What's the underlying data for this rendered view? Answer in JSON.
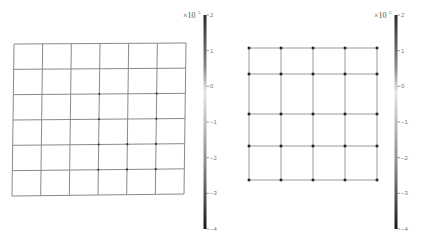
{
  "panels": [
    {
      "id": "left",
      "description": "deformed mesh grid, 6x6 cells",
      "grid": {
        "columns": 6,
        "rows": 6
      },
      "corners": {
        "tl": [
          14,
          44
        ],
        "tr": [
          186,
          43
        ],
        "br": [
          184,
          194
        ],
        "bl": [
          12,
          196
        ]
      },
      "line_color": "#8a8a8a",
      "highlighted_nodes": [
        [
          3,
          2
        ],
        [
          5,
          2
        ],
        [
          3,
          3
        ],
        [
          5,
          3
        ],
        [
          3,
          4
        ],
        [
          4,
          4
        ],
        [
          5,
          4
        ],
        [
          3,
          5
        ],
        [
          4,
          5
        ],
        [
          5,
          5
        ]
      ],
      "colorbar": {
        "multiplier_base": "×10",
        "multiplier_exp": "5",
        "ticks": [
          "2",
          "1",
          "0",
          "−1",
          "−2",
          "−3",
          "−4"
        ],
        "x": 205,
        "y_top": 15,
        "y_bottom": 229
      }
    },
    {
      "id": "right",
      "description": "mesh grid with node markers, 5x4 cells",
      "grid_x": [
        249,
        281,
        313,
        345,
        377
      ],
      "grid_y": [
        48,
        74,
        114,
        146,
        180
      ],
      "extra_x": 377,
      "line_color": "#9a9a9a",
      "node_color": "#222222",
      "colorbar": {
        "multiplier_base": "×10",
        "multiplier_exp": "5",
        "ticks": [
          "2",
          "1",
          "0",
          "−1",
          "−2",
          "−3",
          "−4"
        ],
        "x": 396,
        "y_top": 15,
        "y_bottom": 229
      }
    }
  ],
  "chart_data": [
    {
      "type": "heatmap",
      "title": "",
      "colorbar_label": "×10^5",
      "colorbar_ticks": [
        2,
        1,
        0,
        -1,
        -2,
        -3,
        -4
      ],
      "colorbar_range": [
        -4,
        2
      ],
      "grid": "6x6 quadrilateral mesh"
    },
    {
      "type": "heatmap",
      "title": "",
      "colorbar_label": "×10^5",
      "colorbar_ticks": [
        2,
        1,
        0,
        -1,
        -2,
        -3,
        -4
      ],
      "colorbar_range": [
        -4,
        2
      ],
      "grid": "5x4 mesh with node markers"
    }
  ]
}
